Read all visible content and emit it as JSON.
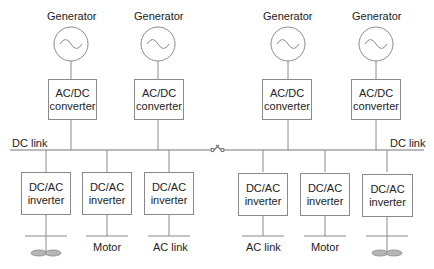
{
  "diagram": {
    "type": "block-diagram",
    "generators": [
      {
        "label": "Generator",
        "converter": [
          "AC/DC",
          "converter"
        ]
      },
      {
        "label": "Generator",
        "converter": [
          "AC/DC",
          "converter"
        ]
      },
      {
        "label": "Generator",
        "converter": [
          "AC/DC",
          "converter"
        ]
      },
      {
        "label": "Generator",
        "converter": [
          "AC/DC",
          "converter"
        ]
      }
    ],
    "bus": {
      "left_label": "DC link",
      "right_label": "DC link",
      "switch": "bus-tie-switch"
    },
    "inverters": [
      {
        "line1": "DC/AC",
        "line2": "inverter",
        "load": "",
        "load_type": "propeller"
      },
      {
        "line1": "DC/AC",
        "line2": "inverter",
        "load": "Motor",
        "load_type": "motor"
      },
      {
        "line1": "DC/AC",
        "line2": "inverter",
        "load": "AC link",
        "load_type": "ac-link"
      },
      {
        "line1": "DC/AC",
        "line2": "inverter",
        "load": "AC link",
        "load_type": "ac-link"
      },
      {
        "line1": "DC/AC",
        "line2": "inverter",
        "load": "Motor",
        "load_type": "motor"
      },
      {
        "line1": "DC/AC",
        "line2": "inverter",
        "load": "",
        "load_type": "propeller"
      }
    ],
    "colors": {
      "line": "#8a8a8a",
      "text": "#222222",
      "propeller": "#b0b0b0"
    }
  }
}
